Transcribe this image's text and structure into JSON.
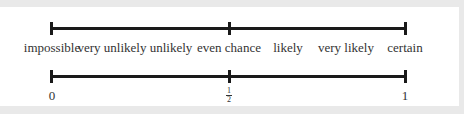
{
  "diagram": {
    "top_scale": {
      "labels": [
        {
          "text": "impossible",
          "x": 52
        },
        {
          "text": "very unlikely",
          "x": 112
        },
        {
          "text": "unlikely",
          "x": 171
        },
        {
          "text": "even chance",
          "x": 229
        },
        {
          "text": "likely",
          "x": 288
        },
        {
          "text": "very likely",
          "x": 346
        },
        {
          "text": "certain",
          "x": 405
        }
      ]
    },
    "bottom_scale": {
      "labels": [
        {
          "text": "0",
          "x": 52
        },
        {
          "text": "1",
          "x": 405
        }
      ],
      "half": {
        "numerator": "1",
        "denominator": "2",
        "x": 229
      }
    },
    "colors": {
      "line": "#1a1a1a",
      "text": "#333333",
      "background": "#ffffff"
    }
  }
}
